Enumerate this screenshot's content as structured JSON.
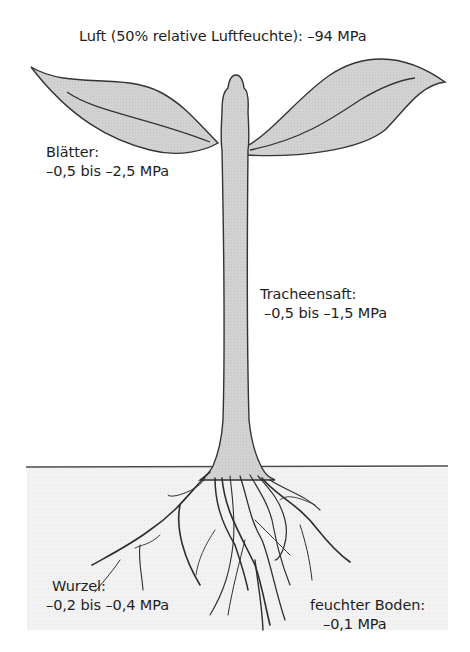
{
  "diagram": {
    "colors": {
      "plant_fill": "#d2d2d2",
      "outline": "#3a3a3a",
      "soil_fill": "#f1f1f1",
      "ground_line": "#4a4a4a",
      "text": "#1e1e1e"
    },
    "nodes": [
      {
        "id": "air",
        "name": "Luft (50% relative Luftfeuchte)",
        "value": "–94 MPa"
      },
      {
        "id": "leaves",
        "name": "Blätter",
        "value": "–0,5 bis –2,5 MPa"
      },
      {
        "id": "xylem",
        "name": "Tracheensaft",
        "value": "–0,5 bis –1,5 MPa"
      },
      {
        "id": "roots",
        "name": "Wurzel",
        "value": "–0,2 bis –0,4 MPa"
      },
      {
        "id": "soil",
        "name": "feuchter Boden",
        "value": "–0,1 MPa"
      }
    ]
  },
  "labels": {
    "air": "Luft (50% relative Luftfeuchte): –94 MPa",
    "leaves_title": "Blätter:",
    "leaves_value": "–0,5 bis –2,5 MPa",
    "xylem_title": "Tracheensaft:",
    "xylem_value": "–0,5 bis –1,5 MPa",
    "roots_title": "Wurzel:",
    "roots_value": "–0,2 bis –0,4 MPa",
    "soil_title": "feuchter Boden:",
    "soil_value": "–0,1 MPa"
  }
}
